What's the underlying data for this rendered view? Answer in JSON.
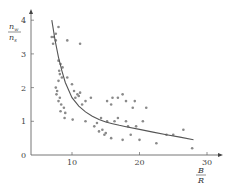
{
  "chart_data": {
    "type": "scatter",
    "title": "",
    "xlabel": {
      "numerator": "B",
      "denominator": "R"
    },
    "ylabel": {
      "numerator": "n",
      "numerator_sub": "w",
      "denominator": "n",
      "denominator_sub": "s"
    },
    "xlim": [
      4,
      31
    ],
    "ylim": [
      0,
      4.2
    ],
    "xticks": [
      10,
      20,
      30
    ],
    "yticks": [
      0,
      1,
      2,
      3,
      4
    ],
    "grid": false,
    "legend": null,
    "colors": {
      "axis": "#666666",
      "points": "#8a8a8a",
      "curve": "#555555",
      "text": "#444444"
    },
    "series": [
      {
        "name": "observations",
        "kind": "scatter",
        "points": [
          [
            7.0,
            3.5
          ],
          [
            7.3,
            3.5
          ],
          [
            7.6,
            3.6
          ],
          [
            8.0,
            3.8
          ],
          [
            7.6,
            3.4
          ],
          [
            7.2,
            3.3
          ],
          [
            9.3,
            3.4
          ],
          [
            11.2,
            3.3
          ],
          [
            8.0,
            2.8
          ],
          [
            8.3,
            2.7
          ],
          [
            8.1,
            2.5
          ],
          [
            8.6,
            2.6
          ],
          [
            8.2,
            2.4
          ],
          [
            8.5,
            2.3
          ],
          [
            9.3,
            2.3
          ],
          [
            8.0,
            2.2
          ],
          [
            10.0,
            2.1
          ],
          [
            7.6,
            2.0
          ],
          [
            7.8,
            1.9
          ],
          [
            7.7,
            1.8
          ],
          [
            8.0,
            1.6
          ],
          [
            8.2,
            1.7
          ],
          [
            8.4,
            1.5
          ],
          [
            8.8,
            1.4
          ],
          [
            8.3,
            1.3
          ],
          [
            9.0,
            1.25
          ],
          [
            8.9,
            1.1
          ],
          [
            10.1,
            1.05
          ],
          [
            10.8,
            1.8
          ],
          [
            10.5,
            1.7
          ],
          [
            10.3,
            1.9
          ],
          [
            11.0,
            1.75
          ],
          [
            11.2,
            1.85
          ],
          [
            11.5,
            1.5
          ],
          [
            12.0,
            1.6
          ],
          [
            12.8,
            1.7
          ],
          [
            12.0,
            1.0
          ],
          [
            13.3,
            0.85
          ],
          [
            13.7,
            0.95
          ],
          [
            14.0,
            0.7
          ],
          [
            14.5,
            0.75
          ],
          [
            14.8,
            0.6
          ],
          [
            15.0,
            0.65
          ],
          [
            14.3,
            1.1
          ],
          [
            15.2,
            1.0
          ],
          [
            16.3,
            1.0
          ],
          [
            16.8,
            1.1
          ],
          [
            15.2,
            1.6
          ],
          [
            15.8,
            1.5
          ],
          [
            16.0,
            1.7
          ],
          [
            16.8,
            1.7
          ],
          [
            17.5,
            1.8
          ],
          [
            18.0,
            1.6
          ],
          [
            19.3,
            1.6
          ],
          [
            19.0,
            1.4
          ],
          [
            18.0,
            1.0
          ],
          [
            18.3,
            0.85
          ],
          [
            19.5,
            0.85
          ],
          [
            18.7,
            0.6
          ],
          [
            15.8,
            0.5
          ],
          [
            17.5,
            0.45
          ],
          [
            20.0,
            0.45
          ],
          [
            21.0,
            1.4
          ],
          [
            20.5,
            1.0
          ],
          [
            22.5,
            0.35
          ],
          [
            24.0,
            0.6
          ],
          [
            25.0,
            0.6
          ],
          [
            26.5,
            0.75
          ],
          [
            27.8,
            0.2
          ]
        ]
      },
      {
        "name": "fitted curve",
        "kind": "line",
        "points": [
          [
            7.0,
            4.0
          ],
          [
            7.5,
            3.4
          ],
          [
            8.0,
            2.9
          ],
          [
            8.5,
            2.5
          ],
          [
            9.0,
            2.15
          ],
          [
            10.0,
            1.7
          ],
          [
            11.0,
            1.45
          ],
          [
            12.0,
            1.28
          ],
          [
            13.0,
            1.15
          ],
          [
            14.0,
            1.05
          ],
          [
            15.0,
            0.98
          ],
          [
            16.0,
            0.93
          ],
          [
            17.0,
            0.88
          ],
          [
            18.0,
            0.84
          ],
          [
            20.0,
            0.76
          ],
          [
            22.0,
            0.68
          ],
          [
            24.0,
            0.6
          ],
          [
            26.0,
            0.53
          ],
          [
            28.0,
            0.45
          ]
        ]
      }
    ]
  }
}
